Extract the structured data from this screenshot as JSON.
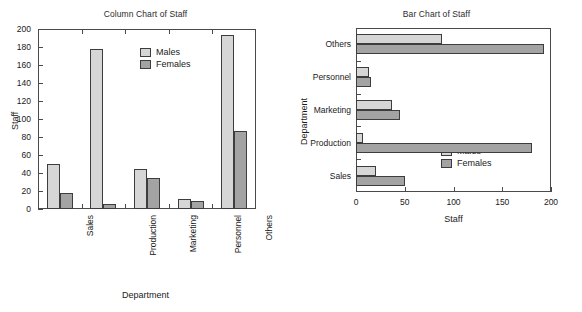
{
  "figure": {
    "background": "#ffffff",
    "series_colors": {
      "males": "#d6d6d6",
      "females": "#a3a3a3"
    },
    "outline_color": "#3d3d3d"
  },
  "chart_data": [
    {
      "type": "bar",
      "orientation": "vertical",
      "title": "Column Chart of Staff",
      "xlabel": "Department",
      "ylabel": "Staff",
      "categories": [
        "Sales",
        "Production",
        "Marketing",
        "Personnel",
        "Others"
      ],
      "series": [
        {
          "name": "Males",
          "color": "#d6d6d6",
          "values": [
            50,
            178,
            45,
            11,
            193
          ]
        },
        {
          "name": "Females",
          "color": "#a3a3a3",
          "values": [
            18,
            6,
            34,
            9,
            87
          ]
        }
      ],
      "ylim": [
        0,
        200
      ],
      "yticks": [
        0,
        20,
        40,
        60,
        80,
        100,
        120,
        140,
        160,
        180,
        200
      ],
      "ytick_labels": [
        "0",
        "20",
        "40",
        "60",
        "80",
        "100",
        "120",
        "140",
        "160",
        "180",
        "200"
      ],
      "grid": false,
      "legend": {
        "position": "top-center",
        "entries": [
          "Males",
          "Females"
        ]
      }
    },
    {
      "type": "bar",
      "orientation": "horizontal",
      "title": "Bar Chart of Staff",
      "xlabel": "Staff",
      "ylabel": "Department",
      "categories": [
        "Sales",
        "Production",
        "Marketing",
        "Personnel",
        "Others"
      ],
      "series": [
        {
          "name": "Males",
          "color": "#d6d6d6",
          "values": [
            20,
            7,
            37,
            13,
            88
          ]
        },
        {
          "name": "Females",
          "color": "#a3a3a3",
          "values": [
            50,
            180,
            45,
            15,
            193
          ]
        }
      ],
      "xlim": [
        0,
        200
      ],
      "xticks": [
        0,
        50,
        100,
        150,
        200
      ],
      "xtick_labels": [
        "0",
        "50",
        "100",
        "150",
        "200"
      ],
      "grid": false,
      "legend": {
        "position": "bottom-right",
        "entries": [
          "Males",
          "Females"
        ]
      }
    }
  ]
}
